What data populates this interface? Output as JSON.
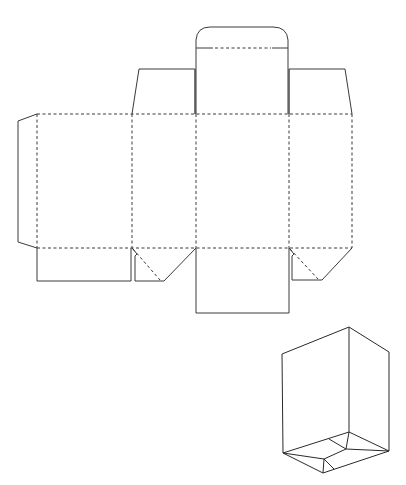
{
  "diagram": {
    "title": "",
    "colors": {
      "background": "#ffffff",
      "line": "#3a3a3a"
    },
    "legend": {
      "cut_line_style": "solid",
      "fold_line_style": "dashed"
    },
    "net": {
      "panels": [
        {
          "name": "glue-flap",
          "x": [
            18,
            37
          ],
          "y": [
            121,
            242
          ]
        },
        {
          "name": "side-panel-1",
          "x": [
            37,
            132
          ],
          "y": [
            114,
            248
          ]
        },
        {
          "name": "front-panel",
          "x": [
            132,
            196
          ],
          "y": [
            114,
            248
          ]
        },
        {
          "name": "side-panel-2",
          "x": [
            196,
            289
          ],
          "y": [
            114,
            248
          ]
        },
        {
          "name": "back-panel",
          "x": [
            289,
            352
          ],
          "y": [
            114,
            248
          ]
        }
      ],
      "top_flaps": [
        {
          "name": "dust-flap-left",
          "x": [
            132,
            196
          ],
          "y": [
            69,
            114
          ]
        },
        {
          "name": "top-lid",
          "x": [
            196,
            289
          ],
          "y": [
            48,
            114
          ]
        },
        {
          "name": "tuck-flap",
          "x": [
            196,
            287
          ],
          "y": [
            27,
            48
          ]
        },
        {
          "name": "dust-flap-right",
          "x": [
            289,
            352
          ],
          "y": [
            69,
            114
          ]
        }
      ],
      "bottom_flaps": [
        {
          "name": "bottom-flap-1",
          "x": [
            37,
            131
          ],
          "y": [
            248,
            281
          ]
        },
        {
          "name": "bottom-lock-flap-2",
          "x": [
            132,
            196
          ],
          "y": [
            248,
            281
          ]
        },
        {
          "name": "bottom-flap-3",
          "x": [
            196,
            289
          ],
          "y": [
            248,
            313
          ]
        },
        {
          "name": "bottom-lock-flap-4",
          "x": [
            289,
            352
          ],
          "y": [
            248,
            280
          ]
        }
      ]
    },
    "assembled_view": {
      "name": "isometric-box",
      "vertices": {
        "top": [
          349,
          327
        ],
        "top_left": [
          282,
          354
        ],
        "top_right": [
          389,
          352
        ],
        "bottom_left": [
          283,
          453
        ],
        "bottom_right": [
          387,
          451
        ],
        "bottom_back": [
          349,
          432
        ],
        "bottom_front": [
          323,
          473
        ]
      }
    }
  }
}
